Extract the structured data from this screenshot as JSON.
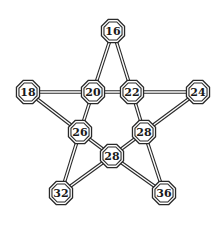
{
  "diagram": {
    "type": "pentagram-graph",
    "colors": {
      "line": "#2a2a2a",
      "background": "#ffffff",
      "text": "#1a1a1a"
    },
    "nodes": [
      {
        "id": "n16",
        "label": "16",
        "x": 113,
        "y": 31
      },
      {
        "id": "n18",
        "label": "18",
        "x": 28,
        "y": 92
      },
      {
        "id": "n20",
        "label": "20",
        "x": 93,
        "y": 92
      },
      {
        "id": "n22",
        "label": "22",
        "x": 132,
        "y": 92
      },
      {
        "id": "n24",
        "label": "24",
        "x": 198,
        "y": 92
      },
      {
        "id": "n26",
        "label": "26",
        "x": 80,
        "y": 132
      },
      {
        "id": "n28r",
        "label": "28",
        "x": 144,
        "y": 132
      },
      {
        "id": "n28c",
        "label": "28",
        "x": 112,
        "y": 156
      },
      {
        "id": "n32",
        "label": "32",
        "x": 61,
        "y": 193
      },
      {
        "id": "n36",
        "label": "36",
        "x": 164,
        "y": 193
      }
    ],
    "edges": [
      [
        "n16",
        "n20"
      ],
      [
        "n16",
        "n22"
      ],
      [
        "n18",
        "n20"
      ],
      [
        "n20",
        "n22"
      ],
      [
        "n22",
        "n24"
      ],
      [
        "n18",
        "n26"
      ],
      [
        "n24",
        "n28r"
      ],
      [
        "n20",
        "n26"
      ],
      [
        "n22",
        "n28r"
      ],
      [
        "n26",
        "n28c"
      ],
      [
        "n28r",
        "n28c"
      ],
      [
        "n26",
        "n32"
      ],
      [
        "n28r",
        "n36"
      ],
      [
        "n32",
        "n28c"
      ],
      [
        "n28c",
        "n36"
      ]
    ]
  }
}
